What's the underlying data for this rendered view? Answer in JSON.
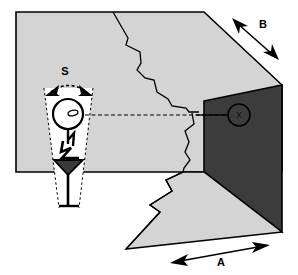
{
  "figure": {
    "type": "technical-illustration",
    "background_color": "#ffffff",
    "line_color": "#000000",
    "fill_light": "#d4d4d4",
    "fill_dark": "#3c3c3c",
    "fill_white": "#ffffff"
  },
  "labels": {
    "span_s": "S",
    "dimension_b": "B",
    "dimension_a": "A",
    "target_x": "X"
  },
  "annotations": {
    "span_s": {
      "text": "S",
      "kind": "curved double-headed arrow spanning the observer's view cone",
      "x": 65,
      "y": 71
    },
    "dimension_b": {
      "text": "B",
      "kind": "straight double-headed dimension arrow along the upper-right sloping edge",
      "x": 263,
      "y": 25
    },
    "dimension_a": {
      "text": "A",
      "kind": "straight double-headed dimension arrow along the lower-right base edge",
      "x": 221,
      "y": 263
    },
    "target_x": {
      "text": "X",
      "kind": "circled X target marker on the dark far wall",
      "x": 239,
      "y": 112
    }
  },
  "elements": {
    "observer": "stick figure with head, eye, bent arm and downward-pointing tool",
    "sight_line": "horizontal dashed line from observer eye to circled X target",
    "view_cone": "white dashed-edge tapering cone extending below the observer",
    "crack_upper": "jagged fracture line crossing the light gray upper face",
    "crack_lower": "jagged fracture line crossing the light gray lower face",
    "dark_face": "dark gray far/side wall panel",
    "light_faces": "light gray floor and upper surfaces"
  }
}
